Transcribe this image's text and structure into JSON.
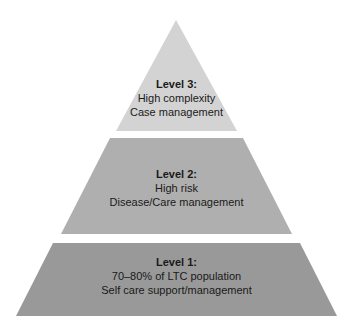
{
  "diagram": {
    "type": "pyramid",
    "colors": {
      "level3": "#d3d3d3",
      "level2": "#afafaf",
      "level1": "#999999",
      "text": "#1a1a1a"
    },
    "tiers": [
      {
        "title": "Level 3:",
        "line1": "High complexity",
        "line2": "Case management"
      },
      {
        "title": "Level 2:",
        "line1": "High risk",
        "line2": "Disease/Care management"
      },
      {
        "title": "Level 1:",
        "line1": "70–80% of LTC population",
        "line2": "Self care support/management"
      }
    ]
  }
}
